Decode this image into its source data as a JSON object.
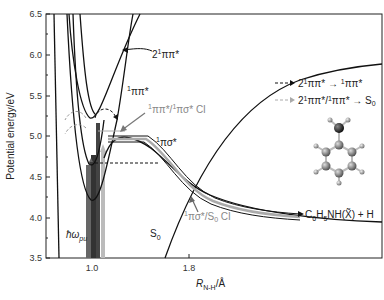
{
  "figure": {
    "yaxis": {
      "label": "Potential energy/eV",
      "ticks": [
        "6.5",
        "6.0",
        "5.5",
        "5.0",
        "4.5",
        "4.0",
        "3.5"
      ],
      "range": [
        3.5,
        6.5
      ]
    },
    "xaxis": {
      "label_main": "R",
      "label_sub": "N-H",
      "label_unit": "/Å",
      "ticks": [
        "1.0",
        "1.8"
      ]
    },
    "curve_labels": {
      "two_pipi": "2",
      "two_pipi_sup": "1",
      "two_pipi_rest": "ππ*",
      "pipi_sup": "1",
      "pipi": "ππ*",
      "pisigma_sup": "1",
      "pisigma": "πσ*",
      "ci_upper_sup1": "1",
      "ci_upper_mid": "ππ*/",
      "ci_upper_sup2": "1",
      "ci_upper_rest": "πσ* CI",
      "ci_lower_sup": "1",
      "ci_lower_rest": "πσ*/S",
      "ci_lower_sub": "0",
      "ci_lower_tail": " CI",
      "s0": "S",
      "s0_sub": "0",
      "hw": "ħω",
      "hw_sub": "pu",
      "product_a": "C",
      "product_a_sub": "6",
      "product_b": "H",
      "product_b_sub": "5",
      "product_c": "NH(X̃) + H"
    },
    "legend": [
      {
        "style": "black-dashed-arrow",
        "text_a": "2",
        "sup_a": "1",
        "text_b": "ππ* → ",
        "sup_b": "1",
        "text_c": "ππ*"
      },
      {
        "style": "gray-dashed-arrow",
        "text_a": "2",
        "sup_a": "1",
        "text_b": "ππ*/",
        "sup_b": "1",
        "text_c": "ππ* → S",
        "sub_c": "0"
      }
    ],
    "molecule": "aniline-ball-and-stick",
    "colors": {
      "curve": "#111111",
      "gray_path": "#999999",
      "dark_bar": "#444444",
      "mid_bar": "#777777",
      "light_bar": "#bbbbbb"
    }
  }
}
